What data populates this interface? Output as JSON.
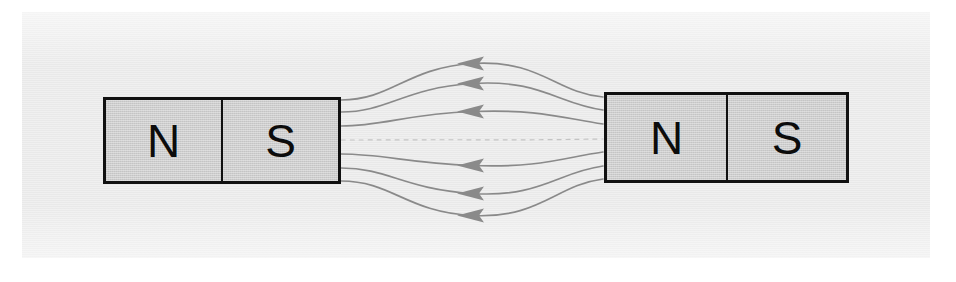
{
  "figure": {
    "background_color": "#e9e9e9",
    "page_color": "#ffffff"
  },
  "magnets": [
    {
      "id": "magnet-left",
      "poles": [
        {
          "label": "N",
          "name": "north-pole"
        },
        {
          "label": "S",
          "name": "south-pole"
        }
      ],
      "fill_color": "#cdcdcd",
      "border_color": "#111111"
    },
    {
      "id": "magnet-right",
      "poles": [
        {
          "label": "N",
          "name": "north-pole"
        },
        {
          "label": "S",
          "name": "south-pole"
        }
      ],
      "fill_color": "#cdcdcd",
      "border_color": "#111111"
    }
  ],
  "field": {
    "line_color": "#8a8a8a",
    "arrow_color": "#8a8a8a",
    "arrow_direction": "left",
    "line_count": 7,
    "dashed_line_index": 3,
    "lines": [
      {
        "name": "field-line-1",
        "y_center": 63,
        "start": [
          341,
          100
        ],
        "end": [
          603,
          96
        ],
        "arrow_x": 472,
        "dashed": false
      },
      {
        "name": "field-line-2",
        "y_center": 83,
        "start": [
          341,
          112
        ],
        "end": [
          603,
          110
        ],
        "arrow_x": 472,
        "dashed": false
      },
      {
        "name": "field-line-3",
        "y_center": 111,
        "start": [
          341,
          126
        ],
        "end": [
          603,
          124
        ],
        "arrow_x": 472,
        "dashed": false
      },
      {
        "name": "field-line-4",
        "y_center": 140,
        "start": [
          341,
          140
        ],
        "end": [
          603,
          139
        ],
        "arrow_x": 472,
        "dashed": true
      },
      {
        "name": "field-line-5",
        "y_center": 165,
        "start": [
          341,
          154
        ],
        "end": [
          603,
          152
        ],
        "arrow_x": 472,
        "dashed": false
      },
      {
        "name": "field-line-6",
        "y_center": 193,
        "start": [
          341,
          168
        ],
        "end": [
          603,
          166
        ],
        "arrow_x": 472,
        "dashed": false
      },
      {
        "name": "field-line-7",
        "y_center": 215,
        "start": [
          341,
          181
        ],
        "end": [
          603,
          179
        ],
        "arrow_x": 472,
        "dashed": false
      }
    ]
  }
}
